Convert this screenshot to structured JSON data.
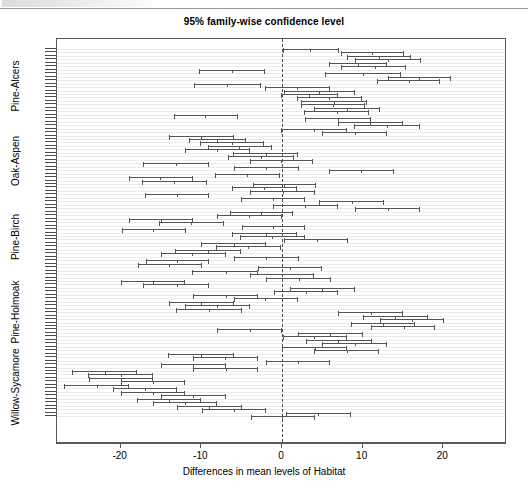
{
  "figure": {
    "title": "95% family-wise confidence level",
    "xlabel": "Differences in mean levels of Habitat",
    "ylabel": ""
  },
  "axis": {
    "x_ticks": [
      "-20",
      "-10",
      "0",
      "10",
      "20"
    ],
    "y_groups": [
      "Pine-Alcers",
      "Oak-Aspen",
      "Pine-Birch",
      "Pine-Holmoak",
      "Willow-Sycamore"
    ]
  },
  "colors": {
    "line": "#555555",
    "frame": "#595959",
    "stripe": "#ebebeb",
    "reference": "#4d4d4d",
    "text": "#000000",
    "background": "#ffffff"
  },
  "chart_data": {
    "type": "errorbar",
    "title": "95% family-wise confidence level",
    "subtitle": "",
    "xlabel": "Differences in mean levels of Habitat",
    "ylabel": "",
    "xlim": [
      -27.9,
      27.9
    ],
    "xticks": [
      -20,
      -10,
      0,
      10,
      20
    ],
    "grid": "horizontal-stripes",
    "legend": "none",
    "reference_line": 0,
    "orientation": "horizontal",
    "n_comparisons": 105,
    "group_labels": [
      "Pine-Alcers",
      "Oak-Aspen",
      "Pine-Birch",
      "Pine-Holmoak",
      "Willow-Sycamore"
    ],
    "series_name": "Tukey 95% confidence intervals",
    "intervals": [
      {
        "lower": 0.1,
        "center": 3.5,
        "upper": 7.1
      },
      {
        "lower": 7.3,
        "center": 11.2,
        "upper": 15.1
      },
      {
        "lower": 8.0,
        "center": 12.0,
        "upper": 16.0
      },
      {
        "lower": 9.0,
        "center": 13.1,
        "upper": 17.2
      },
      {
        "lower": 5.8,
        "center": 9.4,
        "upper": 13.0
      },
      {
        "lower": 7.3,
        "center": 11.5,
        "upper": 15.4
      },
      {
        "lower": -10.3,
        "center": -6.2,
        "upper": -2.1
      },
      {
        "lower": 5.3,
        "center": 10.0,
        "upper": 14.8
      },
      {
        "lower": 13.1,
        "center": 17.0,
        "upper": 21.0
      },
      {
        "lower": 11.8,
        "center": 15.8,
        "upper": 19.6
      },
      {
        "lower": -10.9,
        "center": -6.8,
        "upper": -2.6
      },
      {
        "lower": -2.1,
        "center": 1.8,
        "upper": 5.9
      },
      {
        "lower": 0.2,
        "center": 4.6,
        "upper": 9.0
      },
      {
        "lower": -0.1,
        "center": 3.4,
        "upper": 6.9
      },
      {
        "lower": 1.8,
        "center": 5.8,
        "upper": 9.9
      },
      {
        "lower": 2.4,
        "center": 6.5,
        "upper": 10.5
      },
      {
        "lower": 2.3,
        "center": 6.3,
        "upper": 10.3
      },
      {
        "lower": 4.0,
        "center": 8.1,
        "upper": 12.1
      },
      {
        "lower": 2.7,
        "center": 6.8,
        "upper": 10.8
      },
      {
        "lower": -13.4,
        "center": -9.5,
        "upper": -5.4
      },
      {
        "lower": 2.9,
        "center": 7.0,
        "upper": 11.0
      },
      {
        "lower": 6.9,
        "center": 10.9,
        "upper": 15.0
      },
      {
        "lower": 8.9,
        "center": 13.0,
        "upper": 17.1
      },
      {
        "lower": -0.1,
        "center": 4.0,
        "upper": 8.0
      },
      {
        "lower": 4.9,
        "center": 9.0,
        "upper": 13.0
      },
      {
        "lower": -14.0,
        "center": -10.0,
        "upper": -5.9
      },
      {
        "lower": -11.5,
        "center": -8.0,
        "upper": -4.5
      },
      {
        "lower": -10.2,
        "center": -6.2,
        "upper": -2.2
      },
      {
        "lower": -9.2,
        "center": -5.3,
        "upper": -1.3
      },
      {
        "lower": -12.0,
        "center": -8.1,
        "upper": -4.0
      },
      {
        "lower": -6.1,
        "center": -2.0,
        "upper": 2.0
      },
      {
        "lower": -6.7,
        "center": -2.6,
        "upper": 1.5
      },
      {
        "lower": -4.0,
        "center": -0.1,
        "upper": 3.9
      },
      {
        "lower": -17.2,
        "center": -13.2,
        "upper": -9.1
      },
      {
        "lower": -6.0,
        "center": -2.0,
        "upper": 2.1
      },
      {
        "lower": 5.8,
        "center": 9.8,
        "upper": 13.9
      },
      {
        "lower": -8.3,
        "center": -4.3,
        "upper": -0.2
      },
      {
        "lower": -19.0,
        "center": -15.1,
        "upper": -11.0
      },
      {
        "lower": -17.4,
        "center": -13.4,
        "upper": -9.3
      },
      {
        "lower": -3.6,
        "center": 0.3,
        "upper": 4.2
      },
      {
        "lower": -6.2,
        "center": -2.2,
        "upper": 1.8
      },
      {
        "lower": -4.0,
        "center": 0.1,
        "upper": 4.1
      },
      {
        "lower": -17.0,
        "center": -13.0,
        "upper": -9.0
      },
      {
        "lower": -5.1,
        "center": -1.1,
        "upper": 2.9
      },
      {
        "lower": 4.6,
        "center": 8.7,
        "upper": 12.7
      },
      {
        "lower": -1.1,
        "center": 2.9,
        "upper": 7.0
      },
      {
        "lower": 9.0,
        "center": 13.1,
        "upper": 17.1
      },
      {
        "lower": -6.5,
        "center": -2.6,
        "upper": 1.4
      },
      {
        "lower": -8.1,
        "center": -4.1,
        "upper": 0.0
      },
      {
        "lower": -19.0,
        "center": -15.0,
        "upper": -11.0
      },
      {
        "lower": -15.3,
        "center": -11.3,
        "upper": -7.2
      },
      {
        "lower": -5.0,
        "center": -1.1,
        "upper": 2.9
      },
      {
        "lower": -19.9,
        "center": -16.0,
        "upper": -11.9
      },
      {
        "lower": -6.2,
        "center": -2.0,
        "upper": 1.9
      },
      {
        "lower": -5.2,
        "center": -1.2,
        "upper": 2.9
      },
      {
        "lower": 0.2,
        "center": 4.3,
        "upper": 8.2
      },
      {
        "lower": -10.1,
        "center": -6.0,
        "upper": -2.0
      },
      {
        "lower": -8.2,
        "center": -4.2,
        "upper": -0.1
      },
      {
        "lower": -13.3,
        "center": -9.2,
        "upper": -5.1
      },
      {
        "lower": -15.0,
        "center": -11.1,
        "upper": -7.0
      },
      {
        "lower": -6.0,
        "center": -2.0,
        "upper": 2.1
      },
      {
        "lower": -16.9,
        "center": -13.0,
        "upper": -9.0
      },
      {
        "lower": -17.9,
        "center": -14.0,
        "upper": -9.9
      },
      {
        "lower": -3.0,
        "center": 1.0,
        "upper": 5.0
      },
      {
        "lower": -11.2,
        "center": -7.0,
        "upper": -3.0
      },
      {
        "lower": -4.0,
        "center": 0.0,
        "upper": 4.0
      },
      {
        "lower": -2.0,
        "center": 2.1,
        "upper": 6.1
      },
      {
        "lower": -20.0,
        "center": -16.0,
        "upper": -12.0
      },
      {
        "lower": -17.2,
        "center": -13.0,
        "upper": -9.0
      },
      {
        "lower": 1.0,
        "center": 5.0,
        "upper": 9.0
      },
      {
        "lower": -1.0,
        "center": 3.0,
        "upper": 7.0
      },
      {
        "lower": -11.0,
        "center": -7.0,
        "upper": -3.0
      },
      {
        "lower": -6.0,
        "center": -2.1,
        "upper": 2.0
      },
      {
        "lower": -14.0,
        "center": -10.1,
        "upper": -6.0
      },
      {
        "lower": -12.0,
        "center": -8.0,
        "upper": -4.0
      },
      {
        "lower": -13.1,
        "center": -9.0,
        "upper": -5.0
      },
      {
        "lower": 7.0,
        "center": 11.0,
        "upper": 15.0
      },
      {
        "lower": 10.0,
        "center": 14.0,
        "upper": 18.1
      },
      {
        "lower": 12.1,
        "center": 16.1,
        "upper": 20.1
      },
      {
        "lower": 8.5,
        "center": 12.5,
        "upper": 16.5
      },
      {
        "lower": 11.0,
        "center": 15.1,
        "upper": 19.0
      },
      {
        "lower": -8.0,
        "center": -4.0,
        "upper": 0.0
      },
      {
        "lower": 2.0,
        "center": 6.0,
        "upper": 10.0
      },
      {
        "lower": 0.1,
        "center": 4.0,
        "upper": 8.1
      },
      {
        "lower": 3.0,
        "center": 7.0,
        "upper": 11.1
      },
      {
        "lower": 5.0,
        "center": 9.0,
        "upper": 13.0
      },
      {
        "lower": 0.0,
        "center": 4.1,
        "upper": 8.0
      },
      {
        "lower": 4.0,
        "center": 8.0,
        "upper": 12.0
      },
      {
        "lower": -14.1,
        "center": -10.0,
        "upper": -6.0
      },
      {
        "lower": -11.0,
        "center": -7.1,
        "upper": -3.0
      },
      {
        "lower": -2.0,
        "center": 2.0,
        "upper": 6.0
      },
      {
        "lower": -15.0,
        "center": -11.0,
        "upper": -7.0
      },
      {
        "lower": -11.0,
        "center": -7.0,
        "upper": -3.0
      },
      {
        "lower": -26.0,
        "center": -22.0,
        "upper": -18.0
      },
      {
        "lower": -24.0,
        "center": -20.0,
        "upper": -16.0
      },
      {
        "lower": -23.9,
        "center": -20.0,
        "upper": -16.0
      },
      {
        "lower": -20.0,
        "center": -16.0,
        "upper": -12.0
      },
      {
        "lower": -27.0,
        "center": -23.0,
        "upper": -19.0
      },
      {
        "lower": -21.0,
        "center": -17.0,
        "upper": -13.0
      },
      {
        "lower": -20.0,
        "center": -16.0,
        "upper": -12.0
      },
      {
        "lower": -15.0,
        "center": -11.0,
        "upper": -7.0
      },
      {
        "lower": -18.0,
        "center": -14.0,
        "upper": -10.0
      },
      {
        "lower": -16.0,
        "center": -12.0,
        "upper": -8.0
      },
      {
        "lower": -13.0,
        "center": -9.0,
        "upper": -5.0
      },
      {
        "lower": -9.9,
        "center": -6.0,
        "upper": -2.0
      },
      {
        "lower": 0.5,
        "center": 4.5,
        "upper": 8.6
      },
      {
        "lower": -3.9,
        "center": 0.0,
        "upper": 4.1
      }
    ]
  }
}
